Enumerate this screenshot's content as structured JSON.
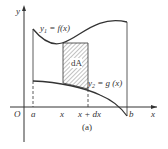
{
  "diagram": {
    "axes": {
      "x_label": "x",
      "y_label": "y",
      "origin_label": "O"
    },
    "curves": {
      "upper": {
        "label_y": "y",
        "label_sub": "1",
        "label_rest": " = f(x)"
      },
      "lower": {
        "label_y": "y",
        "label_sub": "2",
        "label_rest": " = g (x)"
      }
    },
    "element_label": "dA",
    "ticks": {
      "a": "a",
      "x": "x",
      "x_dx": "x + dx",
      "b": "b"
    },
    "caption": "(a)",
    "colors": {
      "stroke": "#333333",
      "hatch": "#555555"
    }
  }
}
